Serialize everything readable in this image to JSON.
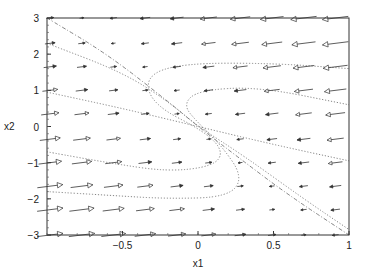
{
  "chart_data": {
    "type": "quiver",
    "title": "",
    "xlabel": "x1",
    "ylabel": "x2",
    "xlim": [
      -1,
      1
    ],
    "ylim": [
      -3,
      3
    ],
    "grid": false,
    "legend": null,
    "xticks": [
      -0.5,
      0,
      0.5,
      1
    ],
    "xtick_labels": [
      "−0.5",
      "0",
      "0.5",
      "1"
    ],
    "yticks": [
      -3,
      -2,
      -1,
      0,
      1,
      2,
      3
    ],
    "ytick_labels": [
      "−3",
      "−2",
      "−1",
      "0",
      "1",
      "2",
      "3"
    ],
    "vector_field": {
      "description": "Direction field arrows on a 10x10 grid; arrows point right in lower-left, left in upper-right, magnitude grows toward corners",
      "grid_x": [
        -0.98,
        -0.77,
        -0.56,
        -0.35,
        -0.14,
        0.07,
        0.28,
        0.49,
        0.7,
        0.91
      ],
      "grid_y": [
        3.0,
        2.3,
        1.65,
        1.0,
        0.35,
        -0.35,
        -1.0,
        -1.65,
        -2.3,
        -3.0
      ]
    },
    "trajectories": [
      {
        "name": "separatrix-solid",
        "style": "dash-dot",
        "points": [
          [
            -1.0,
            3.0
          ],
          [
            -0.6,
            2.0
          ],
          [
            -0.2,
            0.7
          ],
          [
            0.0,
            0.0
          ],
          [
            0.25,
            -0.8
          ],
          [
            0.6,
            -1.9
          ],
          [
            1.0,
            -3.0
          ]
        ]
      },
      {
        "name": "traj-1",
        "style": "dotted",
        "points": [
          [
            -1.0,
            2.3
          ],
          [
            -0.5,
            1.5
          ],
          [
            -0.2,
            0.7
          ],
          [
            0.0,
            0.0
          ],
          [
            0.3,
            -0.8
          ],
          [
            0.7,
            -2.0
          ],
          [
            1.0,
            -2.85
          ]
        ]
      },
      {
        "name": "traj-2",
        "style": "dotted",
        "points": [
          [
            -1.0,
            0.95
          ],
          [
            -0.5,
            0.5
          ],
          [
            0.0,
            0.0
          ],
          [
            0.5,
            -0.5
          ],
          [
            1.0,
            -0.95
          ]
        ]
      },
      {
        "name": "traj-3",
        "style": "dotted",
        "points": [
          [
            -1.0,
            -0.7
          ],
          [
            -0.6,
            -1.0
          ],
          [
            -0.2,
            -1.25
          ],
          [
            0.1,
            -1.1
          ],
          [
            0.17,
            -0.7
          ],
          [
            0.05,
            -0.15
          ],
          [
            -0.3,
            0.6
          ],
          [
            -0.35,
            1.4
          ],
          [
            -0.1,
            1.75
          ],
          [
            0.5,
            1.75
          ],
          [
            1.0,
            1.6
          ]
        ]
      },
      {
        "name": "traj-4",
        "style": "dotted",
        "points": [
          [
            -1.0,
            -1.8
          ],
          [
            -0.6,
            -1.9
          ],
          [
            -0.2,
            -2.0
          ],
          [
            0.2,
            -1.95
          ],
          [
            0.3,
            -1.4
          ],
          [
            0.15,
            -0.5
          ],
          [
            0.0,
            0.1
          ],
          [
            -0.1,
            0.6
          ],
          [
            0.0,
            1.0
          ],
          [
            0.4,
            1.1
          ],
          [
            1.0,
            0.6
          ]
        ]
      }
    ]
  }
}
